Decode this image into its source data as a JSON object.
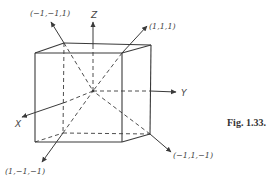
{
  "figure": {
    "caption": "Fig. 1.33.",
    "axes": {
      "x": "X",
      "y": "Y",
      "z": "Z"
    },
    "vertex_labels": {
      "top_back_left": "(−1,−1,1)",
      "top_front_right": "(1,1,1)",
      "bottom_back_left": "(1,−1,−1)",
      "bottom_back_right": "(−1,1,−1)"
    },
    "colors": {
      "line": "#3a3a3a",
      "text": "#444444",
      "background": "#ffffff"
    }
  }
}
